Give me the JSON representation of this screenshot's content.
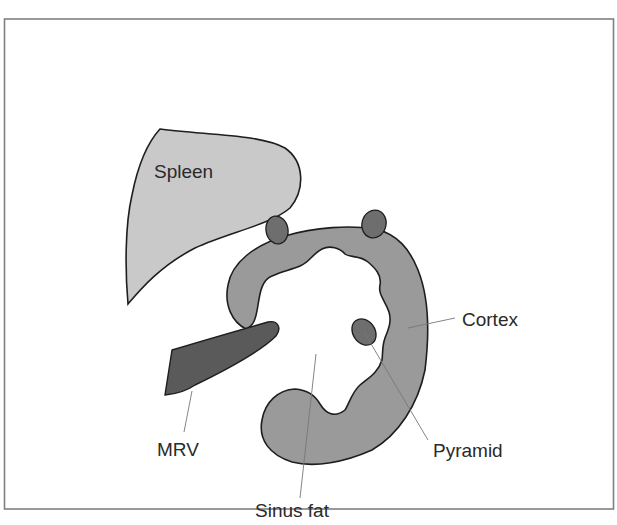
{
  "diagram": {
    "type": "anatomical-schematic",
    "labels": {
      "spleen": "Spleen",
      "cortex": "Cortex",
      "pyramid": "Pyramid",
      "mrv": "MRV",
      "sinus_fat": "Sinus fat"
    },
    "colors": {
      "frame": "#808080",
      "spleen_fill": "#c9c9c9",
      "cortex_fill": "#9a9a9a",
      "pyramid_fill": "#6e6e6e",
      "mrv_fill": "#5a5a5a",
      "sinus_fat_fill": "#ffffff",
      "outline": "#1e1e1e",
      "text": "#2a2a2a"
    }
  }
}
